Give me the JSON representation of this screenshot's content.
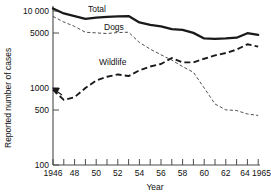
{
  "chart_data": {
    "type": "line",
    "title": "",
    "xlabel": "Year",
    "ylabel": "Reported number of cases",
    "yscale": "log",
    "ylim": [
      100,
      13000
    ],
    "xlim": [
      1946,
      1965
    ],
    "grid": false,
    "legend": "inline-labels",
    "ytick_values": [
      100,
      500,
      1000,
      5000,
      10000
    ],
    "ytick_labels": [
      "100",
      "500",
      "1000",
      "5000",
      "10 000"
    ],
    "xtick_values": [
      1946,
      1947,
      1948,
      1949,
      1950,
      1951,
      1952,
      1953,
      1954,
      1955,
      1956,
      1957,
      1958,
      1959,
      1960,
      1961,
      1962,
      1963,
      1964,
      1965
    ],
    "xtick_labels": [
      "1946",
      "",
      "48",
      "",
      "50",
      "",
      "52",
      "",
      "54",
      "",
      "56",
      "",
      "58",
      "",
      "60",
      "",
      "62",
      "",
      "64",
      "1965"
    ],
    "annotations": [
      {
        "text": "Total",
        "x": 1949.5,
        "y": 11500
      },
      {
        "text": "Dogs",
        "x": 1951.0,
        "y": 7200
      },
      {
        "text": "Wildlife",
        "x": 1950.5,
        "y": 2350
      }
    ],
    "x": [
      1946,
      1947,
      1948,
      1949,
      1950,
      1951,
      1952,
      1953,
      1954,
      1955,
      1956,
      1957,
      1958,
      1959,
      1960,
      1961,
      1962,
      1963,
      1964,
      1965
    ],
    "series": [
      {
        "name": "Total",
        "style": "solid-thick",
        "color": "#1a1a1a",
        "values": [
          10800,
          9300,
          8600,
          7900,
          8200,
          8400,
          8500,
          8600,
          7100,
          6600,
          6300,
          5800,
          5700,
          5200,
          4400,
          4350,
          4400,
          4500,
          5150,
          4900
        ]
      },
      {
        "name": "Dogs",
        "style": "fine-dashed",
        "color": "#3a3a3a",
        "values": [
          8500,
          7200,
          6300,
          5300,
          5200,
          5100,
          5250,
          5300,
          3900,
          3200,
          2700,
          2300,
          1900,
          1600,
          1000,
          620,
          520,
          510,
          460,
          440
        ]
      },
      {
        "name": "Wildlife",
        "style": "bold-dashed",
        "color": "#1a1a1a",
        "values": [
          950,
          700,
          760,
          1000,
          1250,
          1400,
          1500,
          1430,
          1700,
          1900,
          2050,
          2450,
          2150,
          2150,
          2400,
          2650,
          2850,
          3150,
          3700,
          3450
        ]
      }
    ],
    "marker_annotation": {
      "name": "wildlife-start-arrow",
      "x": 1946,
      "y": 950
    }
  }
}
